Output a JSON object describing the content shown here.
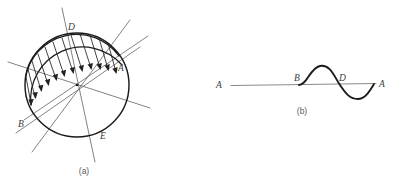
{
  "figure": {
    "background_color": "#ffffff",
    "ink_color": "#1b1b1b",
    "thin_line_color": "#5a5a5a",
    "label_color": "#3a3a3a",
    "panels": [
      {
        "id": "a",
        "caption": "(a)",
        "caption_x": 84,
        "caption_y": 172,
        "description": "circle with inclined diameters and a distributed load of arrows along the upper arc",
        "circle": {
          "cx": 77,
          "cy": 85,
          "r": 52
        },
        "center_label": "",
        "diameters": [
          {
            "name": "diameter-D-E",
            "angle_deg": -72,
            "extend": 30
          },
          {
            "name": "diameter-A-B",
            "angle_deg": 22,
            "extend": 26
          },
          {
            "name": "diameter-secondary-1",
            "angle_deg": -40,
            "extend": 24
          },
          {
            "name": "diameter-secondary-2",
            "angle_deg": 58,
            "extend": 22
          }
        ],
        "labels": [
          {
            "text": "D",
            "x": 68,
            "y": 30
          },
          {
            "text": "A",
            "x": 120,
            "y": 70
          },
          {
            "text": "B",
            "x": 21,
            "y": 126
          },
          {
            "text": "E",
            "x": 102,
            "y": 138
          }
        ],
        "load_arrows": {
          "count": 12,
          "start_angle_deg": 182,
          "end_angle_deg": 290,
          "description": "arrows pointing inward toward a chord from the outer arc"
        }
      },
      {
        "id": "b",
        "caption": "(b)",
        "caption_x": 302,
        "caption_y": 112,
        "description": "straight baseline A to A with an S-shaped sine wave between B and A crossing at D",
        "baseline": {
          "x1": 231,
          "y1": 85,
          "x2": 376,
          "y2": 83
        },
        "labels": [
          {
            "text": "A",
            "x": 219,
            "y": 88
          },
          {
            "text": "B",
            "x": 297,
            "y": 81
          },
          {
            "text": "D",
            "x": 341,
            "y": 81
          },
          {
            "text": "A",
            "x": 381,
            "y": 87
          }
        ],
        "wave": {
          "start_x": 299,
          "crossing_x": 338,
          "end_x": 372,
          "amplitude": 12,
          "description": "one full sine period: crest between B and D, trough between D and A"
        }
      }
    ]
  }
}
